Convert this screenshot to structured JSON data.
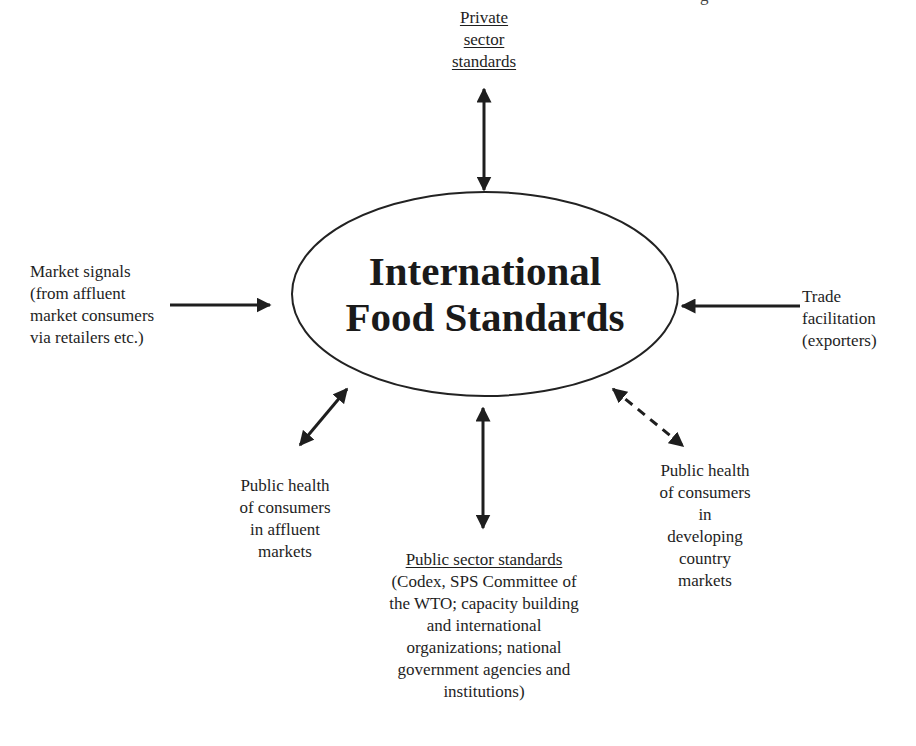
{
  "diagram": {
    "type": "hub-and-spoke",
    "center": {
      "lines": [
        "International",
        "Food Standards"
      ]
    },
    "nodes": {
      "top": {
        "lines": [
          "Private",
          "sector",
          "standards"
        ],
        "underlined": true,
        "arrow": "bidirectional"
      },
      "left": {
        "lines": [
          "Market signals",
          "(from affluent",
          "market consumers",
          "via retailers etc.)"
        ],
        "arrow": "into-center"
      },
      "right": {
        "lines": [
          "Trade",
          "facilitation",
          "(exporters)"
        ],
        "arrow": "into-center"
      },
      "bottom_left": {
        "lines": [
          "Public health",
          "of consumers",
          "in affluent",
          "markets"
        ],
        "arrow": "bidirectional"
      },
      "bottom": {
        "heading": "Public sector standards",
        "lines": [
          "(Codex, SPS Committee of",
          "the WTO; capacity building",
          "and international",
          "organizations; national",
          "government agencies and",
          "institutions)"
        ],
        "arrow": "bidirectional"
      },
      "bottom_right": {
        "lines": [
          "Public health",
          "of consumers",
          "in",
          "developing",
          "country",
          "markets"
        ],
        "arrow": "bidirectional-dashed"
      }
    },
    "cropped_header_glyph": "g",
    "colors": {
      "ink": "#1e1e1e",
      "background": "#ffffff"
    }
  }
}
